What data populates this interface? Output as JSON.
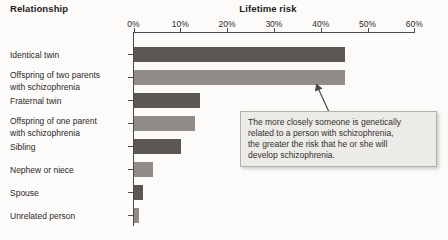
{
  "headers": {
    "category_header": "Relationship",
    "value_header": "Lifetime risk"
  },
  "axis": {
    "tick_labels": [
      "0%",
      "10%",
      "20%",
      "30%",
      "40%",
      "50%",
      "60%"
    ]
  },
  "chart_data": {
    "type": "bar",
    "orientation": "horizontal",
    "title": "Lifetime risk",
    "xlabel": "Lifetime risk",
    "ylabel": "Relationship",
    "xlim": [
      0,
      60
    ],
    "x_ticks": [
      0,
      10,
      20,
      30,
      40,
      50,
      60
    ],
    "unit": "%",
    "grid": false,
    "legend": false,
    "categories": [
      "Identical twin",
      "Offspring of two parents\nwith schizophrenia",
      "Fraternal twin",
      "Offspring of one parent\nwith schizophrenia",
      "Sibling",
      "Nephew or niece",
      "Spouse",
      "Unrelated person"
    ],
    "values": [
      45,
      45,
      14,
      13,
      10,
      4,
      2,
      1
    ],
    "bar_color_pattern": "alternating",
    "bar_colors": [
      "#5b5753",
      "#908c87"
    ]
  },
  "callout": {
    "text": "The more closely someone is genetically\nrelated to a person with schizophrenia,\nthe greater the risk that he or she will\ndevelop schizophrenia."
  },
  "colors": {
    "background": "#fcfbf9",
    "axis": "#4c4a47",
    "text": "#2b2a28",
    "bar_dark": "#5b5753",
    "bar_medium": "#908c87",
    "callout_bg": "#edebe7",
    "callout_border": "#b3b0aa"
  }
}
